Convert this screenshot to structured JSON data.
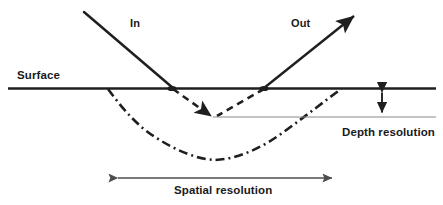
{
  "figure": {
    "kind": "beam-interaction-resolution-diagram",
    "background_color": "#ffffff",
    "width": 443,
    "height": 205
  },
  "labels": {
    "in": "In",
    "out": "Out",
    "surface": "Surface",
    "depth_resolution": "Depth resolution",
    "spatial_resolution": "Spatial resolution"
  },
  "colors": {
    "line_dark": "#1f1f1f",
    "line_gray": "#8a8a8a",
    "arrow_gray": "#4d4d4d",
    "text": "#1a1a1a"
  },
  "geometry": {
    "surface_line": {
      "x1": 8,
      "y1": 88.5,
      "x2": 436,
      "y2": 88.5,
      "stroke_width": 2.6
    },
    "incoming_ray": {
      "x1": 84,
      "y1": 12,
      "x2": 173,
      "y2": 88,
      "stroke_width": 2.4,
      "has_arrowhead": false
    },
    "outgoing_ray": {
      "x1": 264,
      "y1": 88,
      "x2": 357,
      "y2": 14,
      "stroke_width": 2.4,
      "has_arrowhead": true
    },
    "entry_point": {
      "x": 172,
      "y": 88
    },
    "exit_point": {
      "x": 264,
      "y": 88
    },
    "shallow_v_dashed": {
      "points": [
        [
          173,
          89
        ],
        [
          214,
          117
        ],
        [
          264,
          89
        ]
      ],
      "dash": "7,5",
      "stroke_width": 2.6,
      "vertex_arrowhead": {
        "x": 214,
        "y": 117
      }
    },
    "deep_v_dashdot": {
      "points": [
        [
          108,
          89
        ],
        [
          150,
          130
        ],
        [
          182,
          153
        ],
        [
          215,
          160
        ],
        [
          252,
          152
        ],
        [
          300,
          122
        ],
        [
          341,
          89
        ]
      ],
      "dash": "9,4,2,4",
      "stroke_width": 2.6
    },
    "depth_reference_line": {
      "x1": 213,
      "y1": 117,
      "x2": 436,
      "y2": 117,
      "stroke_width": 1.1,
      "color": "#8a8a8a"
    },
    "depth_resolution_arrow": {
      "x": 382,
      "y_top": 88,
      "y_bottom": 117,
      "double_headed": true,
      "stroke_width": 1.8
    },
    "spatial_resolution_arrow": {
      "y": 178,
      "x_left": 114,
      "x_right": 336,
      "double_headed": true,
      "stroke_width": 1.5
    }
  }
}
